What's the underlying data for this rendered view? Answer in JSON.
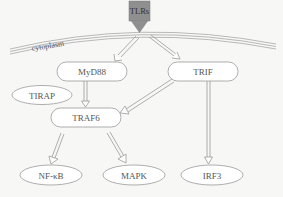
{
  "diagram": {
    "receptor": {
      "label": "TLRs",
      "color": "#8f8f8f"
    },
    "compartment_label": "cytoplasm",
    "nodes": {
      "myd88": {
        "label": "MyD88",
        "shape": "rounded-rect"
      },
      "trif": {
        "label": "TRIF",
        "shape": "rounded-rect"
      },
      "tirap": {
        "label": "TIRAP",
        "shape": "ellipse"
      },
      "traf6": {
        "label": "TRAF6",
        "shape": "rounded-rect"
      },
      "nfkb": {
        "label": "NF-κB",
        "shape": "ellipse"
      },
      "mapk": {
        "label": "MAPK",
        "shape": "ellipse"
      },
      "irf3": {
        "label": "IRF3",
        "shape": "ellipse"
      }
    },
    "edges": [
      {
        "from": "TLRs",
        "to": "MyD88"
      },
      {
        "from": "TLRs",
        "to": "TRIF"
      },
      {
        "from": "MyD88",
        "to": "TRAF6"
      },
      {
        "from": "TRIF",
        "to": "TRAF6"
      },
      {
        "from": "TRIF",
        "to": "IRF3"
      },
      {
        "from": "TRAF6",
        "to": "NF-κB"
      },
      {
        "from": "TRAF6",
        "to": "MAPK"
      }
    ],
    "colors": {
      "stroke": "#9a9a9a",
      "text": "#555555",
      "background": "#f7f7f6"
    }
  }
}
